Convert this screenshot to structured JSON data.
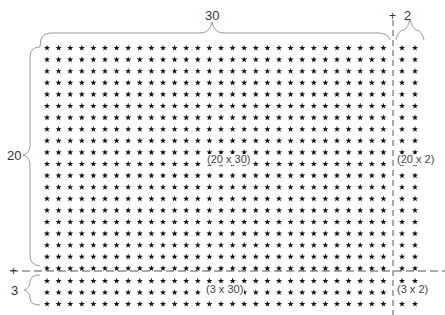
{
  "diagram": {
    "top_labels": {
      "main_width": "30",
      "plus": "+",
      "extra_width": "2"
    },
    "left_labels": {
      "main_height": "20",
      "plus": "+",
      "extra_height": "3"
    },
    "regions": [
      {
        "id": "top-left",
        "label": "(20 x 30)",
        "rows": 20,
        "cols": 30
      },
      {
        "id": "top-right",
        "label": "(20 x 2)",
        "rows": 20,
        "cols": 2
      },
      {
        "id": "bottom-left",
        "label": "(3 x 30)",
        "rows": 3,
        "cols": 30
      },
      {
        "id": "bottom-right",
        "label": "(3 x 2)",
        "rows": 3,
        "cols": 2
      }
    ],
    "star_glyph": "star-icon",
    "colors": {
      "star": "#111111",
      "line": "#555555",
      "brace": "#999999"
    }
  }
}
